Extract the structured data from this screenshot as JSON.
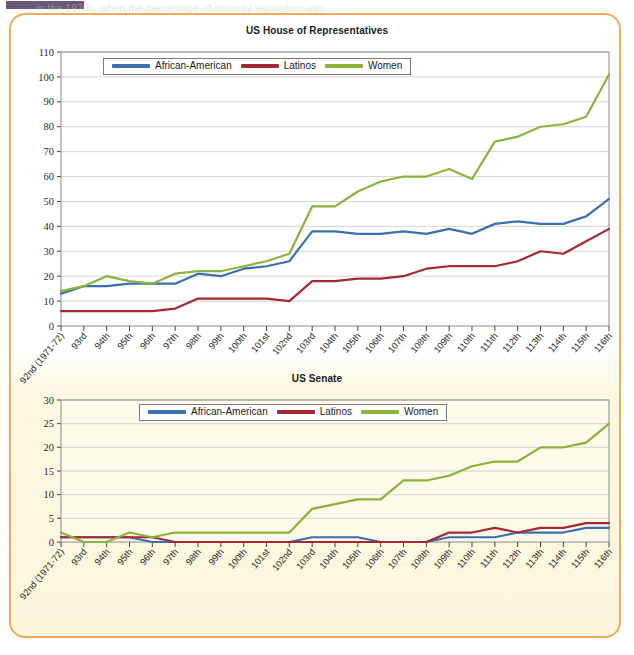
{
  "page": {
    "marker_color": "#5c4a6e",
    "frame_color": "#f0a95c",
    "background_top": "#ffffff",
    "background_bottom": "#fcf6dd"
  },
  "series_colors": {
    "african_american": "#3a6fb0",
    "latinos": "#a52834",
    "women": "#8cb23c"
  },
  "legend": {
    "items": [
      {
        "label": "African-American",
        "color": "#3a6fb0",
        "key": "african_american"
      },
      {
        "label": "Latinos",
        "color": "#a52834",
        "key": "latinos"
      },
      {
        "label": "Women",
        "color": "#8cb23c",
        "key": "women"
      }
    ]
  },
  "bleed_text": {
    "line1": "in the 1970s, when the percentage of minority legislators was",
    "line2": "both houses of Congress, although women remain a",
    "line3": "while the number of women senators has"
  },
  "chart_data": [
    {
      "id": "house",
      "type": "line",
      "title": "US House of Representatives",
      "xlabel": "",
      "ylabel": "",
      "ylim": [
        0,
        110
      ],
      "ytick_step": 10,
      "grid": true,
      "legend_position": "top-left-inside",
      "categories": [
        "92nd (1971-72)",
        "93rd",
        "94th",
        "95th",
        "96th",
        "97th",
        "98th",
        "99th",
        "100th",
        "101st",
        "102nd",
        "103rd",
        "104th",
        "105th",
        "106th",
        "107th",
        "108th",
        "109th",
        "110th",
        "111th",
        "112th",
        "113th",
        "114th",
        "115th",
        "116th"
      ],
      "series": [
        {
          "name": "African-American",
          "color": "#3a6fb0",
          "values": [
            13,
            16,
            16,
            17,
            17,
            17,
            21,
            20,
            23,
            24,
            26,
            38,
            38,
            37,
            37,
            38,
            37,
            39,
            37,
            41,
            42,
            41,
            41,
            44,
            51
          ]
        },
        {
          "name": "Latinos",
          "color": "#a52834",
          "values": [
            6,
            6,
            6,
            6,
            6,
            7,
            11,
            11,
            11,
            11,
            10,
            18,
            18,
            19,
            19,
            20,
            23,
            24,
            24,
            24,
            26,
            30,
            29,
            34,
            39
          ]
        },
        {
          "name": "Women",
          "color": "#8cb23c",
          "values": [
            14,
            16,
            20,
            18,
            17,
            21,
            22,
            22,
            24,
            26,
            29,
            48,
            48,
            54,
            58,
            60,
            60,
            63,
            59,
            74,
            76,
            80,
            81,
            84,
            101
          ]
        }
      ]
    },
    {
      "id": "senate",
      "type": "line",
      "title": "US Senate",
      "xlabel": "",
      "ylabel": "",
      "ylim": [
        0,
        30
      ],
      "ytick_step": 5,
      "grid": true,
      "legend_position": "top-center",
      "categories": [
        "92nd (1971-72)",
        "93rd",
        "94th",
        "95th",
        "96th",
        "97th",
        "98th",
        "99th",
        "100th",
        "101st",
        "102nd",
        "103rd",
        "104th",
        "105th",
        "106th",
        "107th",
        "108th",
        "109th",
        "110th",
        "111th",
        "112th",
        "113th",
        "114th",
        "115th",
        "116th"
      ],
      "series": [
        {
          "name": "African-American",
          "color": "#3a6fb0",
          "values": [
            1,
            1,
            1,
            1,
            0,
            0,
            0,
            0,
            0,
            0,
            0,
            1,
            1,
            1,
            0,
            0,
            0,
            1,
            1,
            1,
            2,
            2,
            2,
            3,
            3
          ]
        },
        {
          "name": "Latinos",
          "color": "#a52834",
          "values": [
            1,
            1,
            1,
            1,
            1,
            0,
            0,
            0,
            0,
            0,
            0,
            0,
            0,
            0,
            0,
            0,
            0,
            2,
            2,
            3,
            2,
            3,
            3,
            4,
            4
          ]
        },
        {
          "name": "Women",
          "color": "#8cb23c",
          "values": [
            2,
            0,
            0,
            2,
            1,
            2,
            2,
            2,
            2,
            2,
            2,
            7,
            8,
            9,
            9,
            13,
            13,
            14,
            16,
            17,
            17,
            20,
            20,
            21,
            25
          ]
        }
      ]
    }
  ]
}
